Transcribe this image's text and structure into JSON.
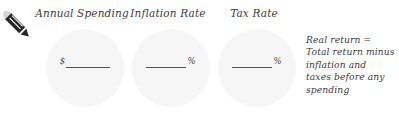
{
  "icon": {
    "name": "pencil-icon",
    "body_color": "#262626",
    "eraser_color": "#d9d9d9"
  },
  "colors": {
    "background": "#ffffff",
    "circle_fill": "#f6f6f6",
    "text": "#3c3c3c",
    "rule": "#555555"
  },
  "fields": [
    {
      "id": "annual-spending",
      "label": "Annual Spending",
      "symbol": "$",
      "symbol_position": "left",
      "value": "",
      "placeholder": ""
    },
    {
      "id": "inflation-rate",
      "label": "Inflation Rate",
      "symbol": "%",
      "symbol_position": "right",
      "value": "",
      "placeholder": ""
    },
    {
      "id": "tax-rate",
      "label": "Tax Rate",
      "symbol": "%",
      "symbol_position": "right",
      "value": "",
      "placeholder": ""
    }
  ],
  "note": {
    "lines": [
      "Real return =",
      "Total return minus",
      "inflation and",
      "taxes before any",
      "spending"
    ]
  }
}
